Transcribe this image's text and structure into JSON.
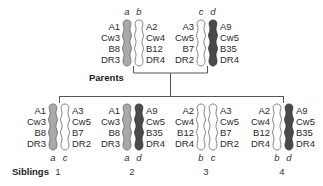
{
  "diagram": {
    "parents_label": "Parents",
    "siblings_label": "Siblings",
    "colors": {
      "a": "#a9a9a9",
      "b": "#ffffff",
      "c": "#ffffff",
      "d": "#4a4a4a",
      "outline": "#555555",
      "line": "#555555"
    },
    "haplotypes": {
      "a": [
        "A1",
        "Cw3",
        "B8",
        "DR3"
      ],
      "b": [
        "A2",
        "Cw4",
        "B12",
        "DR4"
      ],
      "c": [
        "A3",
        "Cw5",
        "B7",
        "DR2"
      ],
      "d": [
        "A9",
        "Cw5",
        "B35",
        "DR4"
      ]
    },
    "parents": [
      {
        "name": "parent-1",
        "left": "a",
        "right": "b",
        "left_alleles": [
          "A1",
          "Cw3",
          "B8",
          "DR3"
        ],
        "right_alleles": [
          "A2",
          "Cw4",
          "B12",
          "DR4"
        ]
      },
      {
        "name": "parent-2",
        "left": "c",
        "right": "d",
        "left_alleles": [
          "A3",
          "Cw5",
          "B7",
          "DR2"
        ],
        "right_alleles": [
          "A9",
          "Cw5",
          "B35",
          "DR4"
        ]
      }
    ],
    "siblings": [
      {
        "number": "1",
        "left": "a",
        "right": "c",
        "left_alleles": [
          "A1",
          "Cw3",
          "B8",
          "DR3"
        ],
        "right_alleles": [
          "A3",
          "Cw5",
          "B7",
          "DR2"
        ]
      },
      {
        "number": "2",
        "left": "a",
        "right": "d",
        "left_alleles": [
          "A1",
          "Cw3",
          "B8",
          "DR3"
        ],
        "right_alleles": [
          "A9",
          "Cw5",
          "B35",
          "DR4"
        ]
      },
      {
        "number": "3",
        "left": "b",
        "right": "c",
        "left_alleles": [
          "A2",
          "Cw4",
          "B12",
          "DR4"
        ],
        "right_alleles": [
          "A3",
          "Cw5",
          "B7",
          "DR2"
        ]
      },
      {
        "number": "4",
        "left": "b",
        "right": "d",
        "left_alleles": [
          "A2",
          "Cw4",
          "B12",
          "DR4"
        ],
        "right_alleles": [
          "A9",
          "Cw5",
          "B35",
          "DR4"
        ]
      }
    ]
  }
}
